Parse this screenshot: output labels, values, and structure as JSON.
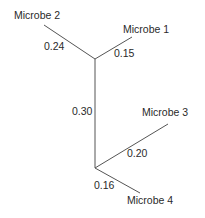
{
  "diagram": {
    "type": "unrooted phylogenetic tree",
    "line_color": "#555555",
    "leaves": [
      {
        "name": "Microbe 1",
        "branch_length": "0.15"
      },
      {
        "name": "Microbe 2",
        "branch_length": "0.24"
      },
      {
        "name": "Microbe 3",
        "branch_length": "0.20"
      },
      {
        "name": "Microbe 4",
        "branch_length": "0.16"
      }
    ],
    "internal_branch": {
      "branch_length": "0.30"
    }
  }
}
